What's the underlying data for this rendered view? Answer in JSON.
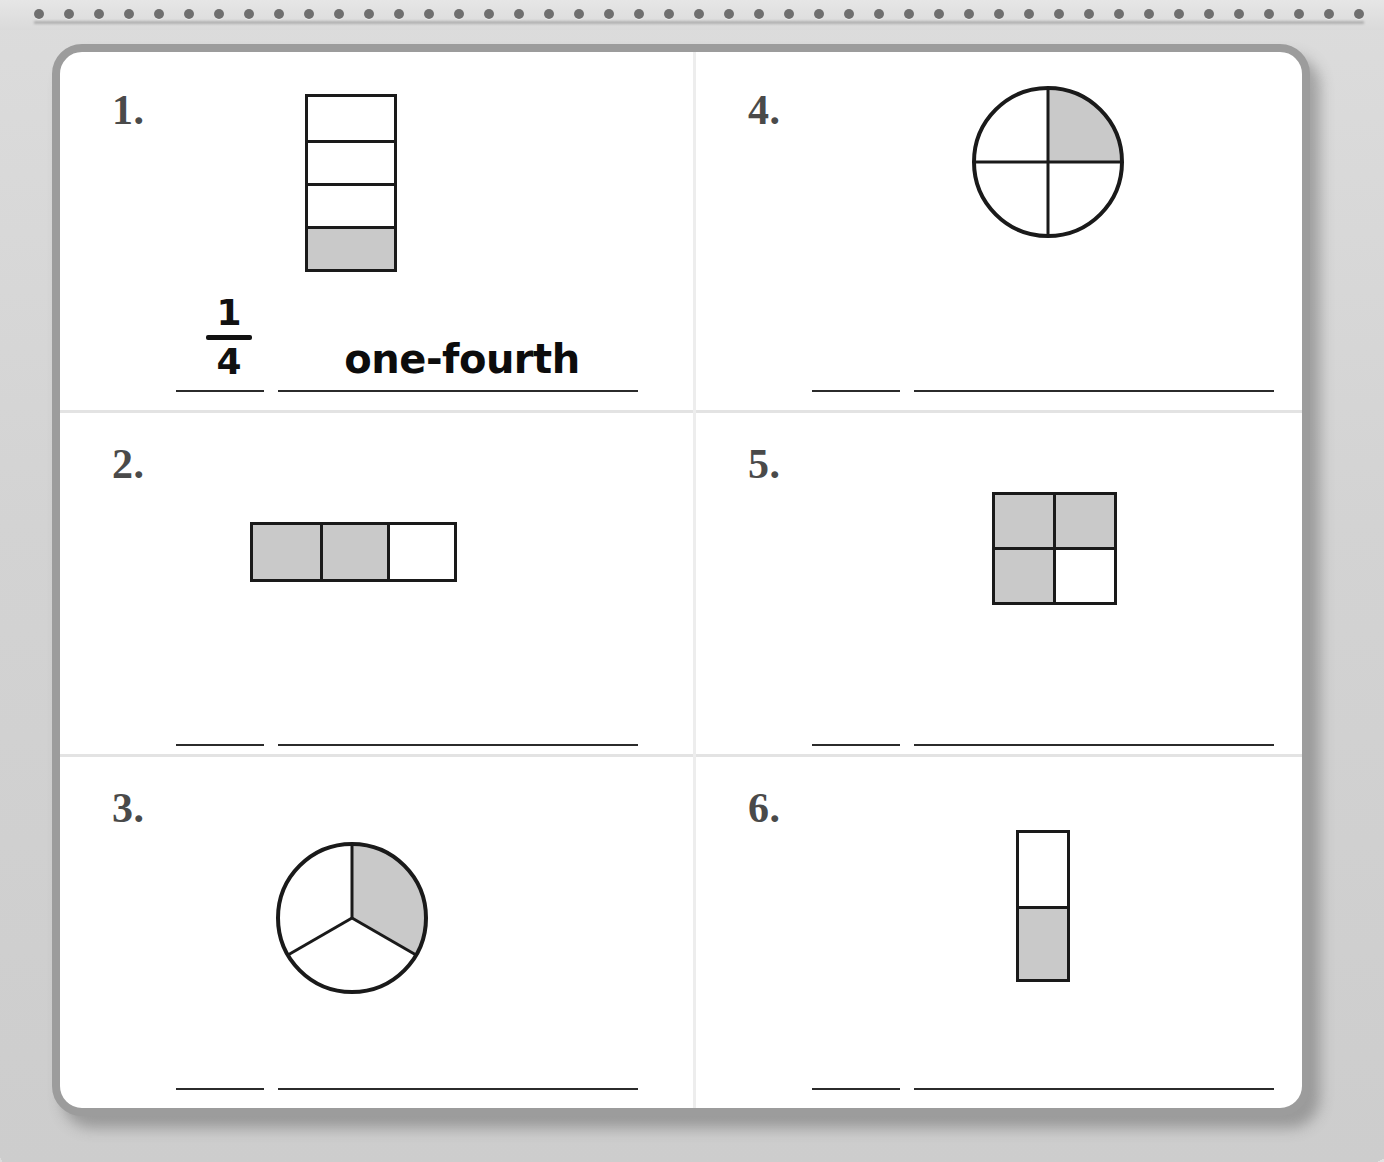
{
  "worksheet": {
    "paper_color": "#ffffff",
    "background_color": "#d2d2d2",
    "card_border_color": "#9c9c9c",
    "shade_color": "#c9c9c9",
    "ink_color": "#1a1a1a",
    "number_color": "#4a4a4a",
    "dot_color": "#6f6f6f",
    "dot_count": 45
  },
  "problems": [
    {
      "number": "1.",
      "figure": {
        "type": "bar-vertical",
        "parts": 4,
        "shaded_parts": 1,
        "shaded_indices": [
          3
        ],
        "fraction": "1/4"
      },
      "answer_fraction_numerator": "1",
      "answer_fraction_denominator": "4",
      "answer_word": "one-fourth",
      "answered": true
    },
    {
      "number": "2.",
      "figure": {
        "type": "bar-horizontal",
        "parts": 3,
        "shaded_parts": 2,
        "shaded_indices": [
          0,
          1
        ],
        "fraction": "2/3"
      },
      "answer_fraction_numerator": "",
      "answer_fraction_denominator": "",
      "answer_word": "",
      "answered": false
    },
    {
      "number": "3.",
      "figure": {
        "type": "circle-sectors",
        "parts": 3,
        "shaded_parts": 1,
        "shaded_indices": [
          0
        ],
        "fraction": "1/3"
      },
      "answer_fraction_numerator": "",
      "answer_fraction_denominator": "",
      "answer_word": "",
      "answered": false
    },
    {
      "number": "4.",
      "figure": {
        "type": "circle-quarters",
        "parts": 4,
        "shaded_parts": 1,
        "shaded_indices": [
          0
        ],
        "fraction": "1/4"
      },
      "answer_fraction_numerator": "",
      "answer_fraction_denominator": "",
      "answer_word": "",
      "answered": false
    },
    {
      "number": "5.",
      "figure": {
        "type": "grid-2x2",
        "parts": 4,
        "shaded_parts": 3,
        "shaded_indices": [
          0,
          1,
          2
        ],
        "fraction": "3/4"
      },
      "answer_fraction_numerator": "",
      "answer_fraction_denominator": "",
      "answer_word": "",
      "answered": false
    },
    {
      "number": "6.",
      "figure": {
        "type": "bar-vertical",
        "parts": 2,
        "shaded_parts": 1,
        "shaded_indices": [
          1
        ],
        "fraction": "1/2"
      },
      "answer_fraction_numerator": "",
      "answer_fraction_denominator": "",
      "answer_word": "",
      "answered": false
    }
  ]
}
